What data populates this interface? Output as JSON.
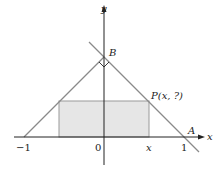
{
  "diagram": {
    "axes": {
      "x_label": "x",
      "y_label": "y"
    },
    "tick_labels": {
      "neg_one": "−1",
      "zero": "0",
      "x": "x",
      "one": "1"
    },
    "points": {
      "A": "A",
      "B": "B",
      "P": "P(x, ?)"
    },
    "colors": {
      "line": "#8a8a8a",
      "axis": "#222222",
      "rect_fill": "#e6e6e6",
      "rect_stroke": "#9a9a9a"
    }
  }
}
